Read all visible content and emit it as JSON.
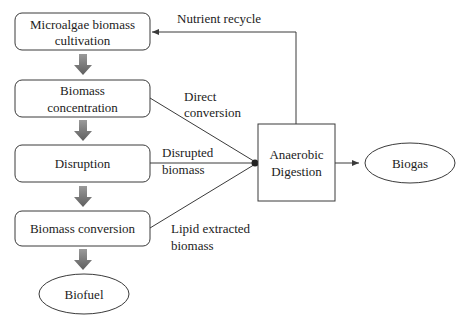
{
  "diagram": {
    "type": "process-flowchart",
    "colors": {
      "stroke": "#3a3a3a",
      "block_arrow": "#6b6b6b",
      "background": "#ffffff",
      "text": "#222222"
    },
    "nodes": {
      "cultivation": {
        "line1": "Microalgae biomass",
        "line2": "cultivation",
        "shape": "rounded-rect"
      },
      "concentration": {
        "line1": "Biomass",
        "line2": "concentration",
        "shape": "rounded-rect"
      },
      "disruption": {
        "line1": "Disruption",
        "shape": "rounded-rect"
      },
      "conversion": {
        "line1": "Biomass conversion",
        "shape": "rounded-rect"
      },
      "biofuel": {
        "line1": "Biofuel",
        "shape": "ellipse"
      },
      "anaerobic_digestion": {
        "line1": "Anaerobic",
        "line2": "Digestion",
        "shape": "rect"
      },
      "biogas": {
        "line1": "Biogas",
        "shape": "ellipse"
      }
    },
    "edge_labels": {
      "nutrient_recycle": "Nutrient recycle",
      "direct_conversion": {
        "line1": "Direct",
        "line2": "conversion"
      },
      "disrupted_biomass": {
        "line1": "Disrupted",
        "line2": "biomass"
      },
      "lipid_extracted": {
        "line1": "Lipid extracted",
        "line2": "biomass"
      }
    },
    "edges": [
      {
        "from": "cultivation",
        "to": "concentration",
        "style": "block-arrow"
      },
      {
        "from": "concentration",
        "to": "disruption",
        "style": "block-arrow"
      },
      {
        "from": "disruption",
        "to": "conversion",
        "style": "block-arrow"
      },
      {
        "from": "conversion",
        "to": "biofuel",
        "style": "block-arrow"
      },
      {
        "from": "concentration",
        "to": "anaerobic_digestion",
        "label": "Direct conversion"
      },
      {
        "from": "disruption",
        "to": "anaerobic_digestion",
        "label": "Disrupted biomass"
      },
      {
        "from": "conversion",
        "to": "anaerobic_digestion",
        "label": "Lipid extracted biomass"
      },
      {
        "from": "anaerobic_digestion",
        "to": "biogas"
      },
      {
        "from": "anaerobic_digestion",
        "to": "cultivation",
        "label": "Nutrient recycle"
      }
    ]
  }
}
